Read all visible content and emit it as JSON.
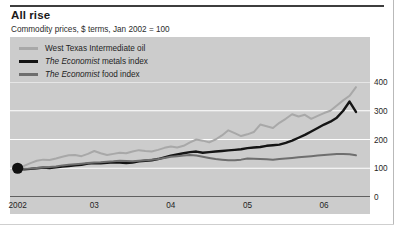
{
  "chart_data": {
    "type": "line",
    "title": "All rise",
    "subtitle": "Commodity prices, $ terms, Jan 2002 = 100",
    "xlabel": "",
    "ylabel": "",
    "ylim": [
      0,
      400
    ],
    "yticks": [
      0,
      100,
      200,
      300,
      400
    ],
    "xticks": [
      "2002",
      "03",
      "04",
      "05",
      "06"
    ],
    "xtick_positions": [
      2002.0,
      2003.0,
      2004.0,
      2005.0,
      2006.0
    ],
    "xlim": [
      2001.9,
      2006.6
    ],
    "grid": "horizontal white gridlines at 100, 200, 300, 400",
    "legend_position": "above plot, left aligned",
    "start_marker": {
      "x": 2002.0,
      "y": 100,
      "shape": "filled-circle",
      "color": "#111111"
    },
    "x": [
      2002.0,
      2002.083,
      2002.167,
      2002.25,
      2002.333,
      2002.417,
      2002.5,
      2002.583,
      2002.667,
      2002.75,
      2002.833,
      2002.917,
      2003.0,
      2003.083,
      2003.167,
      2003.25,
      2003.333,
      2003.417,
      2003.5,
      2003.583,
      2003.667,
      2003.75,
      2003.833,
      2003.917,
      2004.0,
      2004.083,
      2004.167,
      2004.25,
      2004.333,
      2004.417,
      2004.5,
      2004.583,
      2004.667,
      2004.75,
      2004.833,
      2004.917,
      2005.0,
      2005.083,
      2005.167,
      2005.25,
      2005.333,
      2005.417,
      2005.5,
      2005.583,
      2005.667,
      2005.75,
      2005.833,
      2005.917,
      2006.0,
      2006.083,
      2006.167,
      2006.25,
      2006.333,
      2006.417
    ],
    "series": [
      {
        "name": "West Texas Intermediate oil",
        "color": "#a8a8a8",
        "values": [
          100,
          108,
          118,
          126,
          130,
          129,
          134,
          140,
          145,
          146,
          142,
          150,
          160,
          152,
          146,
          150,
          154,
          152,
          158,
          163,
          160,
          158,
          164,
          171,
          176,
          172,
          178,
          190,
          200,
          196,
          190,
          200,
          214,
          232,
          222,
          212,
          218,
          226,
          252,
          246,
          240,
          258,
          272,
          288,
          280,
          286,
          272,
          282,
          292,
          300,
          318,
          336,
          352,
          382
        ]
      },
      {
        "name": "The Economist metals index",
        "color": "#141414",
        "italic_prefix": "The Economist",
        "values": [
          100,
          96,
          98,
          100,
          102,
          101,
          103,
          106,
          108,
          110,
          112,
          116,
          118,
          117,
          119,
          121,
          120,
          118,
          120,
          124,
          126,
          128,
          132,
          138,
          144,
          148,
          152,
          156,
          158,
          154,
          156,
          158,
          160,
          162,
          164,
          166,
          170,
          172,
          174,
          178,
          180,
          182,
          188,
          196,
          206,
          216,
          228,
          240,
          252,
          262,
          276,
          300,
          332,
          296
        ]
      },
      {
        "name": "The Economist food index",
        "color": "#6e6e6e",
        "italic_prefix": "The Economist",
        "values": [
          100,
          98,
          99,
          101,
          103,
          104,
          106,
          110,
          112,
          114,
          116,
          118,
          120,
          121,
          123,
          124,
          126,
          125,
          124,
          126,
          128,
          130,
          132,
          136,
          140,
          142,
          144,
          146,
          144,
          140,
          136,
          132,
          130,
          128,
          128,
          130,
          134,
          133,
          132,
          131,
          130,
          132,
          134,
          136,
          138,
          140,
          142,
          144,
          146,
          148,
          150,
          150,
          149,
          145
        ]
      }
    ]
  }
}
